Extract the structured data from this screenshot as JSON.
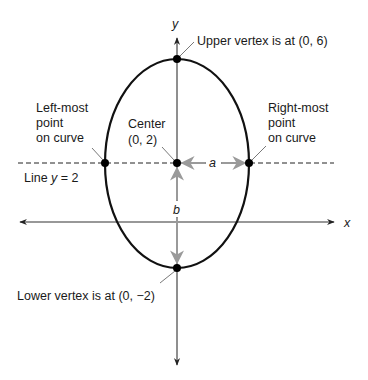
{
  "diagram": {
    "axes": {
      "x_label": "x",
      "y_label": "y"
    },
    "ellipse": {
      "center": [
        0,
        2
      ],
      "upper_vertex": [
        0,
        6
      ],
      "lower_vertex": [
        0,
        -2
      ],
      "semi_axis_labels": {
        "horizontal": "a",
        "vertical": "b"
      }
    },
    "labels": {
      "upper_vertex": "Upper vertex is at (0, 6)",
      "lower_vertex": "Lower vertex is at (0, −2)",
      "center_line1": "Center",
      "center_line2": "(0, 2)",
      "left_line1": "Left-most",
      "left_line2": "point",
      "left_line3": "on curve",
      "right_line1": "Right-most",
      "right_line2": "point",
      "right_line3": "on curve",
      "line_prefix": "Line ",
      "line_var": "y",
      "line_suffix": " = 2",
      "a": "a",
      "b": "b"
    },
    "colors": {
      "curve": "#111111",
      "axis": "#333333",
      "measure_arrow": "#9a9a9a",
      "leader": "#555555"
    }
  }
}
